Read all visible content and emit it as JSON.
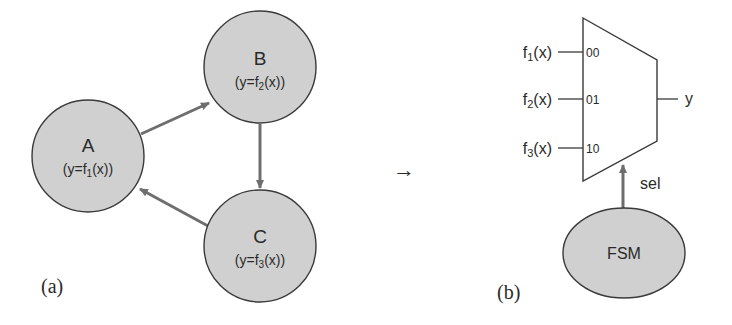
{
  "panel_a": {
    "label": "(a)",
    "nodes": [
      {
        "id": "A",
        "name": "A",
        "expr_prefix": "(y=f",
        "expr_sub": "1",
        "expr_suffix": "(x))"
      },
      {
        "id": "B",
        "name": "B",
        "expr_prefix": "(y=f",
        "expr_sub": "2",
        "expr_suffix": "(x))"
      },
      {
        "id": "C",
        "name": "C",
        "expr_prefix": "(y=f",
        "expr_sub": "3",
        "expr_suffix": "(x))"
      }
    ],
    "edges": [
      {
        "from": "A",
        "to": "B"
      },
      {
        "from": "B",
        "to": "C"
      },
      {
        "from": "C",
        "to": "A"
      }
    ]
  },
  "transform_arrow": "→",
  "panel_b": {
    "label": "(b)",
    "mux_inputs": [
      {
        "fn": "f",
        "sub": "1",
        "arg": "(x)",
        "code": "00"
      },
      {
        "fn": "f",
        "sub": "2",
        "arg": "(x)",
        "code": "01"
      },
      {
        "fn": "f",
        "sub": "3",
        "arg": "(x)",
        "code": "10"
      }
    ],
    "mux_output": "y",
    "select_label": "sel",
    "fsm_label": "FSM"
  },
  "colors": {
    "node_fill": "#d0d0d0",
    "node_stroke": "#3a3a3a",
    "edge": "#6e6e6e",
    "text": "#2a2a2a"
  }
}
